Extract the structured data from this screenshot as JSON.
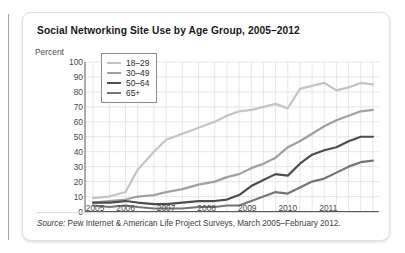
{
  "card": {
    "title": "Social Networking Site Use by Age Group, 2005–2012",
    "source_prefix": "Source:",
    "source_text": " Pew Internet & American Life Project Surveys, March 2005–February 2012."
  },
  "chart_data": {
    "type": "line",
    "title": "Social Networking Site Use by Age Group, 2005–2012",
    "xlabel": "",
    "ylabel": "Percent",
    "ylim": [
      0,
      100
    ],
    "ytick_values": [
      0,
      10,
      20,
      30,
      40,
      50,
      60,
      70,
      80,
      90,
      100
    ],
    "xtick_labels": [
      "2005",
      "2006",
      "2007",
      "2008",
      "2009",
      "2010",
      "2011"
    ],
    "xtick_positions": [
      2005.25,
      2006.0,
      2007.0,
      2008.0,
      2009.0,
      2010.0,
      2011.0
    ],
    "xlim": [
      2005.0,
      2012.25
    ],
    "grid": true,
    "legend_position": "upper-left-inside",
    "x": [
      2005.2,
      2005.6,
      2006.0,
      2006.3,
      2006.7,
      2007.0,
      2007.4,
      2007.8,
      2008.2,
      2008.5,
      2008.8,
      2009.1,
      2009.4,
      2009.7,
      2010.0,
      2010.3,
      2010.6,
      2010.9,
      2011.2,
      2011.5,
      2011.8,
      2012.1
    ],
    "series": [
      {
        "name": "18–29",
        "color": "#c4c4c4",
        "values": [
          9,
          10,
          13,
          28,
          40,
          48,
          52,
          56,
          60,
          64,
          67,
          68,
          70,
          72,
          69,
          82,
          84,
          86,
          81,
          83,
          86,
          85
        ]
      },
      {
        "name": "30–49",
        "color": "#a0a0a0",
        "values": [
          6,
          7,
          8,
          10,
          11,
          13,
          15,
          18,
          20,
          23,
          25,
          29,
          32,
          36,
          43,
          47,
          52,
          57,
          61,
          64,
          67,
          68
        ]
      },
      {
        "name": "50–64",
        "color": "#4d4d4d",
        "values": [
          6,
          6,
          7,
          6,
          5,
          5,
          6,
          7,
          7,
          8,
          11,
          17,
          21,
          25,
          24,
          32,
          38,
          41,
          43,
          47,
          50,
          50
        ]
      },
      {
        "name": "65+",
        "color": "#757575",
        "values": [
          4,
          3,
          4,
          3,
          2,
          2,
          2,
          3,
          3,
          4,
          4,
          7,
          10,
          13,
          12,
          16,
          20,
          22,
          26,
          30,
          33,
          34
        ]
      }
    ]
  }
}
